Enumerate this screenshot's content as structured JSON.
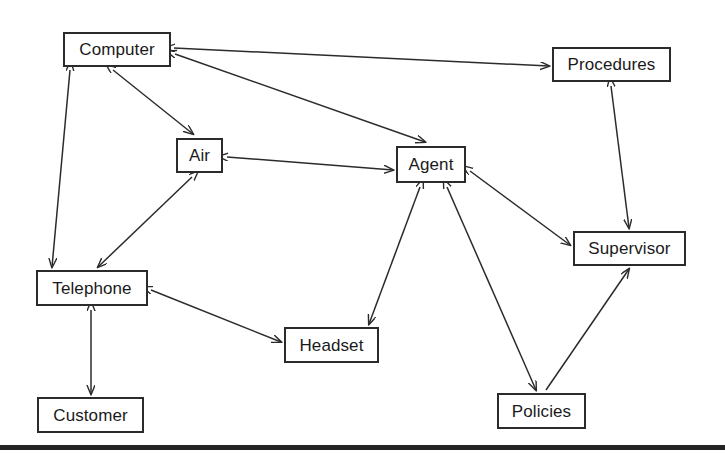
{
  "diagram": {
    "type": "node-link-graph",
    "width": 725,
    "height": 460,
    "background_color": "#ffffff",
    "line_color": "#2b2b2b",
    "text_color": "#1a1a1a",
    "nodes": [
      {
        "id": "computer",
        "label": "Computer",
        "x": 63,
        "y": 32,
        "w": 108,
        "h": 35
      },
      {
        "id": "procedures",
        "label": "Procedures",
        "x": 552,
        "y": 47,
        "w": 119,
        "h": 35
      },
      {
        "id": "air",
        "label": "Air",
        "x": 176,
        "y": 138,
        "w": 47,
        "h": 35
      },
      {
        "id": "agent",
        "label": "Agent",
        "x": 396,
        "y": 146,
        "w": 70,
        "h": 37
      },
      {
        "id": "supervisor",
        "label": "Supervisor",
        "x": 573,
        "y": 231,
        "w": 113,
        "h": 35
      },
      {
        "id": "telephone",
        "label": "Telephone",
        "x": 36,
        "y": 270,
        "w": 112,
        "h": 36
      },
      {
        "id": "headset",
        "label": "Headset",
        "x": 284,
        "y": 327,
        "w": 95,
        "h": 36
      },
      {
        "id": "customer",
        "label": "Customer",
        "x": 37,
        "y": 397,
        "w": 107,
        "h": 36
      },
      {
        "id": "policies",
        "label": "Policies",
        "x": 497,
        "y": 393,
        "w": 89,
        "h": 36
      }
    ],
    "edges": [
      {
        "id": "computer-procedures",
        "from": "computer",
        "to": "procedures",
        "x1": 174,
        "y1": 48,
        "x2": 549,
        "y2": 66,
        "arrows": "both"
      },
      {
        "id": "computer-air",
        "from": "computer",
        "to": "air",
        "x1": 113,
        "y1": 70,
        "x2": 193,
        "y2": 134,
        "arrows": "both"
      },
      {
        "id": "computer-agent",
        "from": "computer",
        "to": "agent",
        "x1": 175,
        "y1": 54,
        "x2": 425,
        "y2": 142,
        "arrows": "both"
      },
      {
        "id": "computer-telephone",
        "from": "computer",
        "to": "telephone",
        "x1": 70,
        "y1": 70,
        "x2": 52,
        "y2": 267,
        "arrows": "both"
      },
      {
        "id": "air-agent",
        "from": "air",
        "to": "agent",
        "x1": 227,
        "y1": 157,
        "x2": 393,
        "y2": 170,
        "arrows": "both"
      },
      {
        "id": "air-telephone",
        "from": "air",
        "to": "telephone",
        "x1": 192,
        "y1": 177,
        "x2": 98,
        "y2": 267,
        "arrows": "both"
      },
      {
        "id": "agent-supervisor",
        "from": "agent",
        "to": "supervisor",
        "x1": 470,
        "y1": 171,
        "x2": 570,
        "y2": 245,
        "arrows": "both"
      },
      {
        "id": "agent-headset",
        "from": "agent",
        "to": "headset",
        "x1": 420,
        "y1": 187,
        "x2": 369,
        "y2": 324,
        "arrows": "both"
      },
      {
        "id": "agent-policies",
        "from": "agent",
        "to": "policies",
        "x1": 447,
        "y1": 187,
        "x2": 536,
        "y2": 390,
        "arrows": "both"
      },
      {
        "id": "procedures-supervisor",
        "from": "procedures",
        "to": "supervisor",
        "x1": 611,
        "y1": 86,
        "x2": 629,
        "y2": 228,
        "arrows": "both"
      },
      {
        "id": "policies-supervisor",
        "from": "policies",
        "to": "supervisor",
        "x1": 546,
        "y1": 390,
        "x2": 629,
        "y2": 269,
        "arrows": "end"
      },
      {
        "id": "telephone-headset",
        "from": "telephone",
        "to": "headset",
        "x1": 151,
        "y1": 290,
        "x2": 281,
        "y2": 342,
        "arrows": "both"
      },
      {
        "id": "telephone-customer",
        "from": "telephone",
        "to": "customer",
        "x1": 91,
        "y1": 310,
        "x2": 91,
        "y2": 394,
        "arrows": "both"
      }
    ],
    "baseline": {
      "x": 0,
      "y": 445,
      "w": 725,
      "h": 5,
      "color": "#242424"
    }
  }
}
